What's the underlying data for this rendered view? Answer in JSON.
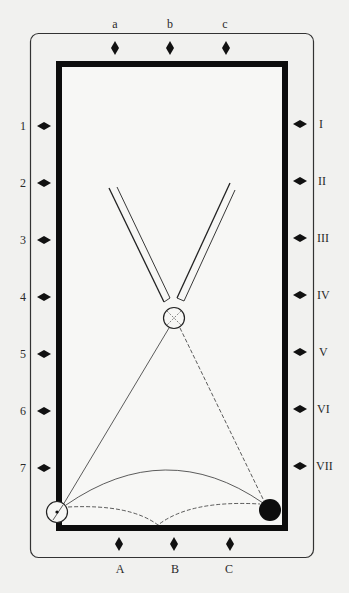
{
  "diagram": {
    "type": "billiards-table-shot-diagram",
    "colors": {
      "background": "#f1f1ef",
      "ink": "#111111",
      "rail": "#0d0d0d",
      "outline": "#333333"
    },
    "top_diamond_labels": [
      "a",
      "b",
      "c"
    ],
    "bottom_diamond_labels": [
      "A",
      "B",
      "C"
    ],
    "left_diamond_labels": [
      "1",
      "2",
      "3",
      "4",
      "5",
      "6",
      "7"
    ],
    "right_diamond_labels": [
      "I",
      "II",
      "III",
      "IV",
      "V",
      "VI",
      "VII"
    ],
    "balls": [
      {
        "name": "object-ball-white",
        "x": 174,
        "y": 318,
        "style": "open-circle-with-cross"
      },
      {
        "name": "cue-ball",
        "x": 57,
        "y": 512,
        "style": "open-circle-with-dot"
      },
      {
        "name": "black-ball",
        "x": 270,
        "y": 510,
        "style": "filled"
      }
    ],
    "cues": [
      {
        "name": "left-cue",
        "from": [
          109,
          188
        ],
        "to": [
          168,
          300
        ]
      },
      {
        "name": "right-cue",
        "from": [
          231,
          182
        ],
        "to": [
          181,
          300
        ]
      }
    ],
    "paths": [
      {
        "name": "solid-line-cue-to-object",
        "style": "solid"
      },
      {
        "name": "dashed-line-object-to-black",
        "style": "dashed"
      },
      {
        "name": "solid-arc-cue-to-black",
        "style": "solid"
      },
      {
        "name": "dashed-bank-via-bottom-rail",
        "style": "dashed",
        "bank_point": [
          158,
          525
        ]
      }
    ]
  }
}
